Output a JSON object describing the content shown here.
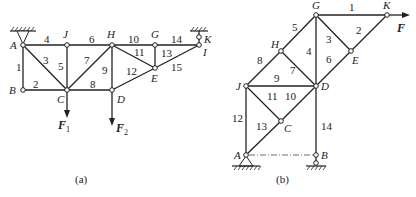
{
  "figure_a": {
    "caption": "(a)",
    "nodes": {
      "A": {
        "label": "A",
        "x": 23,
        "y": 45
      },
      "J": {
        "label": "J",
        "x": 67,
        "y": 45
      },
      "H": {
        "label": "H",
        "x": 112,
        "y": 45
      },
      "G": {
        "label": "G",
        "x": 155,
        "y": 45
      },
      "I": {
        "label": "I",
        "x": 199,
        "y": 45
      },
      "K": {
        "label": "K"
      },
      "B": {
        "label": "B",
        "x": 23,
        "y": 90
      },
      "C": {
        "label": "C",
        "x": 67,
        "y": 90
      },
      "D": {
        "label": "D",
        "x": 112,
        "y": 90
      },
      "E": {
        "label": "E",
        "x": 155,
        "y": 68
      }
    },
    "members": [
      {
        "id": "1",
        "from": "A",
        "to": "B"
      },
      {
        "id": "2",
        "from": "B",
        "to": "C"
      },
      {
        "id": "3",
        "from": "A",
        "to": "C"
      },
      {
        "id": "4",
        "from": "A",
        "to": "J"
      },
      {
        "id": "5",
        "from": "J",
        "to": "C"
      },
      {
        "id": "6",
        "from": "J",
        "to": "H"
      },
      {
        "id": "7",
        "from": "C",
        "to": "H"
      },
      {
        "id": "8",
        "from": "C",
        "to": "D"
      },
      {
        "id": "9",
        "from": "H",
        "to": "D"
      },
      {
        "id": "10",
        "from": "H",
        "to": "G"
      },
      {
        "id": "11",
        "from": "H",
        "to": "E"
      },
      {
        "id": "12",
        "from": "D",
        "to": "E"
      },
      {
        "id": "13",
        "from": "G",
        "to": "E"
      },
      {
        "id": "14",
        "from": "G",
        "to": "I"
      },
      {
        "id": "15",
        "from": "E",
        "to": "I"
      }
    ],
    "loads": [
      {
        "label": "F",
        "subscript": "1",
        "at": "C",
        "direction": "down"
      },
      {
        "label": "F",
        "subscript": "2",
        "at": "D",
        "direction": "down"
      }
    ],
    "supports": [
      {
        "at": "A",
        "type": "pin-ceiling"
      },
      {
        "at": "K",
        "type": "link-ceiling"
      }
    ]
  },
  "figure_b": {
    "caption": "(b)",
    "nodes": {
      "G": {
        "label": "G",
        "x": 316,
        "y": 15
      },
      "K": {
        "label": "K",
        "x": 387,
        "y": 15
      },
      "H": {
        "label": "H",
        "x": 281,
        "y": 51
      },
      "E": {
        "label": "E",
        "x": 351,
        "y": 51
      },
      "J": {
        "label": "J",
        "x": 246,
        "y": 86
      },
      "D": {
        "label": "D",
        "x": 316,
        "y": 86
      },
      "C": {
        "label": "C",
        "x": 281,
        "y": 121
      },
      "A": {
        "label": "A",
        "x": 246,
        "y": 155
      },
      "B": {
        "label": "B",
        "x": 316,
        "y": 155
      }
    },
    "members": [
      {
        "id": "1",
        "from": "G",
        "to": "K"
      },
      {
        "id": "2",
        "from": "K",
        "to": "E"
      },
      {
        "id": "3",
        "from": "G",
        "to": "E"
      },
      {
        "id": "4",
        "from": "G",
        "to": "D"
      },
      {
        "id": "5",
        "from": "G",
        "to": "H"
      },
      {
        "id": "6",
        "from": "E",
        "to": "D"
      },
      {
        "id": "7",
        "from": "H",
        "to": "D"
      },
      {
        "id": "8",
        "from": "H",
        "to": "J"
      },
      {
        "id": "9",
        "from": "J",
        "to": "D"
      },
      {
        "id": "10",
        "from": "D",
        "to": "C"
      },
      {
        "id": "11",
        "from": "J",
        "to": "C"
      },
      {
        "id": "12",
        "from": "J",
        "to": "A"
      },
      {
        "id": "13",
        "from": "C",
        "to": "A"
      },
      {
        "id": "14",
        "from": "D",
        "to": "B"
      }
    ],
    "loads": [
      {
        "label": "F",
        "at": "K",
        "direction": "right"
      }
    ],
    "supports": [
      {
        "at": "A",
        "type": "pin-ground"
      },
      {
        "at": "B",
        "type": "roller-ground"
      }
    ]
  }
}
